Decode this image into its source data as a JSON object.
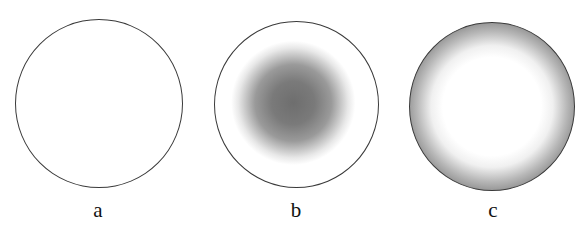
{
  "figure": {
    "panels": [
      {
        "label": "a",
        "description": "uniformly white disc with dark outline"
      },
      {
        "label": "b",
        "description": "white disc with diffuse dark gray central spot"
      },
      {
        "label": "c",
        "description": "gray disc with bright white diffuse center"
      }
    ]
  }
}
